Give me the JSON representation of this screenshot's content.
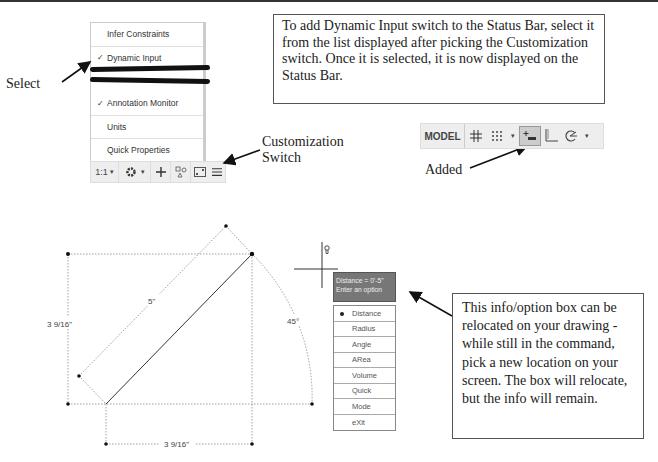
{
  "menu": {
    "items": [
      {
        "label": "Infer Constraints",
        "checked": false
      },
      {
        "label": "Dynamic Input",
        "checked": true
      },
      {
        "label": "Annotation Monitor",
        "checked": true
      },
      {
        "label": "Units",
        "checked": false
      },
      {
        "label": "Quick Properties",
        "checked": false
      }
    ],
    "check_glyph": "✓"
  },
  "status_bar_small": {
    "scale": "1:1",
    "scale_arrow": "▾",
    "gear_arrow": "▾"
  },
  "labels": {
    "select": "Select",
    "customization_line1": "Customization",
    "customization_line2": "Switch",
    "added": "Added"
  },
  "callout_top": {
    "text": "To add Dynamic Input switch to the Status Bar, select it from the list displayed after picking the Customization switch.  Once it is selected, it is now displayed on the Status Bar."
  },
  "status_bar_large": {
    "model_label": "MODEL",
    "arrow": "▾"
  },
  "drawing": {
    "dim_length": "5\"",
    "dim_vertical": "3 9/16\"",
    "dim_horizontal": "3 9/16\"",
    "dim_angle": "45°"
  },
  "tooltip": {
    "line1": "Distance = 0'-5\"",
    "line2": "Enter an option"
  },
  "options": [
    "Distance",
    "Radius",
    "Angle",
    "ARea",
    "Volume",
    "Quick",
    "Mode",
    "eXit"
  ],
  "callout_bottom": {
    "text": "This info/option box can be relocated on your drawing - while still in the command, pick a new location on your screen. The box will relocate, but the info will remain."
  }
}
